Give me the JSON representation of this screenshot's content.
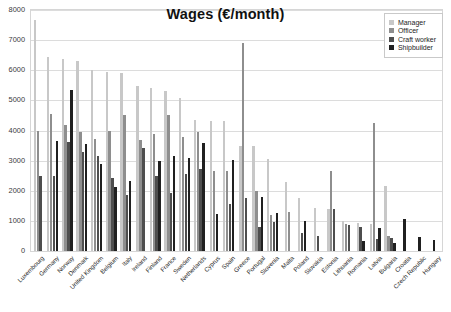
{
  "chart_data": {
    "type": "bar",
    "title": "Wages (€/month)",
    "xlabel": "",
    "ylabel": "",
    "ylim": [
      0,
      8000
    ],
    "ytick_step": 1000,
    "yticks": [
      0,
      1000,
      2000,
      3000,
      4000,
      5000,
      6000,
      7000,
      8000
    ],
    "grid": true,
    "legend_position": "top-right",
    "categories": [
      "Luxembourg",
      "Germany",
      "Norway",
      "Denmark",
      "United Kingdom",
      "Belgium",
      "Italy",
      "Ireland",
      "Finland",
      "France",
      "Sweden",
      "Netherlands",
      "Cyprus",
      "Spain",
      "Greece",
      "Portugal",
      "Slovenia",
      "Malta",
      "Poland",
      "Slovakia",
      "Estonia",
      "Lithuania",
      "Romania",
      "Latvia",
      "Bulgaria",
      "Croatia",
      "Czech Republic",
      "Hungary"
    ],
    "series": [
      {
        "name": "Manager",
        "color": "#c8c8c8",
        "values": [
          7680,
          6430,
          6390,
          6310,
          6020,
          5950,
          5900,
          5470,
          5400,
          5320,
          5070,
          4360,
          4330,
          4310,
          3490,
          3470,
          3070,
          2280,
          1750,
          1420,
          1400,
          990,
          930,
          900,
          2170,
          null,
          null,
          null
        ]
      },
      {
        "name": "Officer",
        "color": "#8e8e8e",
        "values": [
          3970,
          4550,
          4180,
          3960,
          3710,
          3970,
          4510,
          3700,
          3900,
          4500,
          3790,
          3960,
          2640,
          2650,
          6890,
          1990,
          1190,
          1300,
          null,
          null,
          2650,
          900,
          null,
          4240,
          490,
          null,
          null,
          null
        ]
      },
      {
        "name": "Craft worker",
        "color": "#4e4e4e",
        "values": [
          2480,
          2490,
          3610,
          3300,
          3150,
          2410,
          1850,
          3430,
          2500,
          1930,
          2570,
          2730,
          null,
          1570,
          1760,
          800,
          950,
          null,
          590,
          510,
          1390,
          870,
          790,
          400,
          440,
          null,
          null,
          null
        ]
      },
      {
        "name": "Shipbuilder",
        "color": "#202020",
        "values": [
          null,
          3640,
          5350,
          3540,
          2890,
          2140,
          2310,
          null,
          2990,
          3160,
          3080,
          3570,
          1220,
          3030,
          null,
          1780,
          1270,
          null,
          1000,
          null,
          null,
          null,
          320,
          780,
          270,
          1050,
          480,
          380
        ]
      }
    ]
  },
  "legend": {
    "items": [
      {
        "label": "Manager"
      },
      {
        "label": "Officer"
      },
      {
        "label": "Craft worker"
      },
      {
        "label": "Shipbuilder"
      }
    ]
  }
}
